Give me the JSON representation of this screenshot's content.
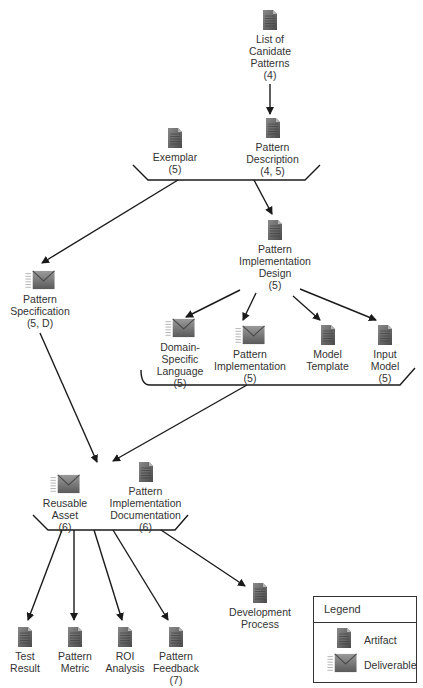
{
  "diagram": {
    "nodes": [
      {
        "id": "list-candidate-patterns",
        "type": "artifact",
        "label": "List of\nCanidate\nPatterns\n(4)"
      },
      {
        "id": "exemplar",
        "type": "artifact",
        "label": "Exemplar\n(5)"
      },
      {
        "id": "pattern-description",
        "type": "artifact",
        "label": "Pattern\nDescription\n(4, 5)"
      },
      {
        "id": "pattern-implementation-design",
        "type": "artifact",
        "label": "Pattern\nImplementation\nDesign\n(5)"
      },
      {
        "id": "pattern-specification",
        "type": "deliverable",
        "label": "Pattern\nSpecification\n(5, D)"
      },
      {
        "id": "domain-specific-language",
        "type": "deliverable",
        "label": "Domain-\nSpecific\nLanguage\n(5)"
      },
      {
        "id": "pattern-implementation",
        "type": "deliverable",
        "label": "Pattern\nImplementation\n(5)"
      },
      {
        "id": "model-template",
        "type": "artifact",
        "label": "Model\nTemplate"
      },
      {
        "id": "input-model",
        "type": "artifact",
        "label": "Input\nModel\n(5)"
      },
      {
        "id": "reusable-asset",
        "type": "deliverable",
        "label": "Reusable\nAsset\n(6)"
      },
      {
        "id": "pattern-implementation-documentation",
        "type": "artifact",
        "label": "Pattern\nImplementation\nDocumentation\n(6)"
      },
      {
        "id": "test-result",
        "type": "artifact",
        "label": "Test\nResult"
      },
      {
        "id": "pattern-metric",
        "type": "artifact",
        "label": "Pattern\nMetric"
      },
      {
        "id": "roi-analysis",
        "type": "artifact",
        "label": "ROI\nAnalysis"
      },
      {
        "id": "pattern-feedback",
        "type": "artifact",
        "label": "Pattern\nFeedback\n(7)"
      },
      {
        "id": "development-process",
        "type": "artifact",
        "label": "Development\nProcess"
      }
    ],
    "groups": [
      {
        "id": "group-1",
        "members": [
          "exemplar",
          "pattern-description"
        ]
      },
      {
        "id": "group-2",
        "members": [
          "domain-specific-language",
          "pattern-implementation",
          "model-template",
          "input-model"
        ]
      },
      {
        "id": "group-3",
        "members": [
          "reusable-asset",
          "pattern-implementation-documentation"
        ]
      }
    ],
    "edges": [
      {
        "from": "list-candidate-patterns",
        "to": "pattern-description"
      },
      {
        "from": "group-1",
        "to": "pattern-specification"
      },
      {
        "from": "group-1",
        "to": "pattern-implementation-design"
      },
      {
        "from": "pattern-implementation-design",
        "to": "domain-specific-language"
      },
      {
        "from": "pattern-implementation-design",
        "to": "pattern-implementation"
      },
      {
        "from": "pattern-implementation-design",
        "to": "model-template"
      },
      {
        "from": "pattern-implementation-design",
        "to": "input-model"
      },
      {
        "from": "pattern-specification",
        "to": "group-3"
      },
      {
        "from": "group-2",
        "to": "group-3"
      },
      {
        "from": "group-3",
        "to": "test-result"
      },
      {
        "from": "group-3",
        "to": "pattern-metric"
      },
      {
        "from": "group-3",
        "to": "roi-analysis"
      },
      {
        "from": "group-3",
        "to": "pattern-feedback"
      },
      {
        "from": "group-3",
        "to": "development-process"
      }
    ]
  },
  "legend": {
    "title": "Legend",
    "items": [
      {
        "icon": "artifact-icon",
        "label": "Artifact"
      },
      {
        "icon": "deliverable-icon",
        "label": "Deliverable"
      }
    ]
  },
  "colors": {
    "line": "#1a1a1a",
    "icon_dark": "#555555",
    "icon_light": "#9a9a9a",
    "text": "#333333"
  }
}
